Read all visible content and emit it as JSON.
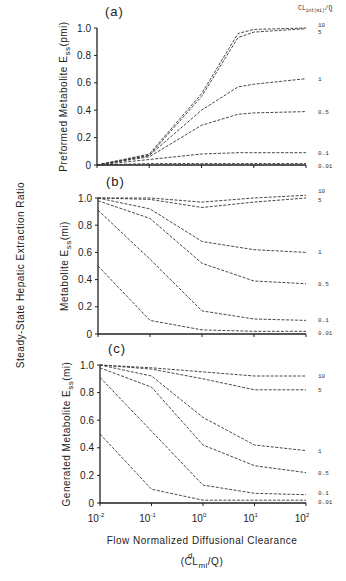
{
  "figure": {
    "shared_ylabel": "Steady-State Hepatic Extraction Ratio",
    "xlabel": "Flow Normalized Diffusional Clearance",
    "xlabel_sub": "(CL",
    "xlabel_sup": "d",
    "xlabel_subscript": "mi",
    "xlabel_tail": "/Q)",
    "legend_title": "CL",
    "legend_title_sub": "int(mi)",
    "legend_title_tail": "/Q",
    "x_ticks": [
      "10",
      "10",
      "10",
      "10",
      "10"
    ],
    "x_tick_exps": [
      "-2",
      "-1",
      "0",
      "1",
      "2"
    ],
    "y_ticks": [
      "0",
      "0.2",
      "0.4",
      "0.6",
      "0.8",
      "1.0"
    ]
  },
  "chart_data": [
    {
      "type": "line",
      "title": "(a)",
      "ylabel": "Preformed Metabolite E_ss(pmi)",
      "xlabel": "Flow Normalized Diffusional Clearance (CL^d_mi/Q)",
      "xscale": "log",
      "xlim": [
        0.01,
        100
      ],
      "ylim": [
        0,
        1.0
      ],
      "x": [
        0.01,
        0.1,
        1,
        5,
        10,
        100
      ],
      "legend_title": "CL_int(mi)/Q",
      "series": [
        {
          "name": "10",
          "values": [
            0.0,
            0.08,
            0.52,
            0.96,
            0.99,
            1.0
          ]
        },
        {
          "name": "5",
          "values": [
            0.0,
            0.07,
            0.5,
            0.93,
            0.97,
            0.995
          ]
        },
        {
          "name": "1",
          "values": [
            0.0,
            0.07,
            0.4,
            0.57,
            0.59,
            0.63
          ]
        },
        {
          "name": "0.5",
          "values": [
            0.0,
            0.06,
            0.29,
            0.37,
            0.38,
            0.39
          ]
        },
        {
          "name": "0.1",
          "values": [
            0.0,
            0.04,
            0.08,
            0.09,
            0.09,
            0.09
          ]
        },
        {
          "name": "0.01",
          "values": [
            0.0,
            0.01,
            0.01,
            0.01,
            0.01,
            0.01
          ]
        }
      ]
    },
    {
      "type": "line",
      "title": "(b)",
      "ylabel": "Metabolite E_ss(mi)",
      "xlabel": "Flow Normalized Diffusional Clearance (CL^d_mi/Q)",
      "xscale": "log",
      "xlim": [
        0.01,
        100
      ],
      "ylim": [
        0,
        1.0
      ],
      "x": [
        0.01,
        0.1,
        1,
        10,
        100
      ],
      "series": [
        {
          "name": "10",
          "values": [
            1.0,
            1.0,
            0.97,
            1.0,
            1.02
          ]
        },
        {
          "name": "5",
          "values": [
            1.0,
            0.99,
            0.93,
            0.97,
            1.0
          ]
        },
        {
          "name": "1",
          "values": [
            1.0,
            0.92,
            0.68,
            0.62,
            0.6
          ]
        },
        {
          "name": "0.5",
          "values": [
            0.98,
            0.85,
            0.52,
            0.39,
            0.37
          ]
        },
        {
          "name": "0.1",
          "values": [
            0.91,
            0.55,
            0.17,
            0.11,
            0.1
          ]
        },
        {
          "name": "0.01",
          "values": [
            0.5,
            0.1,
            0.03,
            0.02,
            0.02
          ]
        }
      ]
    },
    {
      "type": "line",
      "title": "(c)",
      "ylabel": "Generated Metabolite E_ss(mi)",
      "xlabel": "Flow Normalized Diffusional Clearance (CL^d_mi/Q)",
      "xscale": "log",
      "xlim": [
        0.01,
        100
      ],
      "ylim": [
        0,
        1.0
      ],
      "x": [
        0.01,
        0.1,
        1,
        10,
        100
      ],
      "series": [
        {
          "name": "10",
          "values": [
            1.0,
            0.98,
            0.95,
            0.92,
            0.92
          ]
        },
        {
          "name": "5",
          "values": [
            1.0,
            0.97,
            0.9,
            0.82,
            0.82
          ]
        },
        {
          "name": "1",
          "values": [
            1.0,
            0.92,
            0.62,
            0.42,
            0.38
          ]
        },
        {
          "name": "0.5",
          "values": [
            0.98,
            0.84,
            0.42,
            0.27,
            0.22
          ]
        },
        {
          "name": "0.1",
          "values": [
            0.91,
            0.52,
            0.13,
            0.07,
            0.06
          ]
        },
        {
          "name": "0.01",
          "values": [
            0.5,
            0.1,
            0.02,
            0.02,
            0.02
          ]
        }
      ]
    }
  ],
  "panels": [
    {
      "label": "(a)",
      "ylabel_main": "Preformed Metabolite E",
      "ylabel_sub": "ss",
      "ylabel_tail": "(pmi)"
    },
    {
      "label": "(b)",
      "ylabel_main": "Metabolite E",
      "ylabel_sub": "ss",
      "ylabel_tail": "(mi)"
    },
    {
      "label": "(c)",
      "ylabel_main": "Generated Metabolite E",
      "ylabel_sub": "ss",
      "ylabel_tail": "(mi)"
    }
  ]
}
